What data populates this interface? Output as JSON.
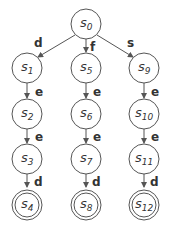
{
  "diagram": {
    "type": "state-machine-tree",
    "states": [
      {
        "id": "s0",
        "label": "s",
        "sub": "0",
        "accepting": false
      },
      {
        "id": "s1",
        "label": "s",
        "sub": "1",
        "accepting": false
      },
      {
        "id": "s2",
        "label": "s",
        "sub": "2",
        "accepting": false
      },
      {
        "id": "s3",
        "label": "s",
        "sub": "3",
        "accepting": false
      },
      {
        "id": "s4",
        "label": "s",
        "sub": "4",
        "accepting": true
      },
      {
        "id": "s5",
        "label": "s",
        "sub": "5",
        "accepting": false
      },
      {
        "id": "s6",
        "label": "s",
        "sub": "6",
        "accepting": false
      },
      {
        "id": "s7",
        "label": "s",
        "sub": "7",
        "accepting": false
      },
      {
        "id": "s8",
        "label": "s",
        "sub": "8",
        "accepting": true
      },
      {
        "id": "s9",
        "label": "s",
        "sub": "9",
        "accepting": false
      },
      {
        "id": "s10",
        "label": "s",
        "sub": "10",
        "accepting": false
      },
      {
        "id": "s11",
        "label": "s",
        "sub": "11",
        "accepting": false
      },
      {
        "id": "s12",
        "label": "s",
        "sub": "12",
        "accepting": true
      }
    ],
    "transitions": [
      {
        "from": "s0",
        "to": "s1",
        "label": "d"
      },
      {
        "from": "s0",
        "to": "s5",
        "label": "f"
      },
      {
        "from": "s0",
        "to": "s9",
        "label": "s"
      },
      {
        "from": "s1",
        "to": "s2",
        "label": "e"
      },
      {
        "from": "s2",
        "to": "s3",
        "label": "e"
      },
      {
        "from": "s3",
        "to": "s4",
        "label": "d"
      },
      {
        "from": "s5",
        "to": "s6",
        "label": "e"
      },
      {
        "from": "s6",
        "to": "s7",
        "label": "e"
      },
      {
        "from": "s7",
        "to": "s8",
        "label": "d"
      },
      {
        "from": "s9",
        "to": "s10",
        "label": "e"
      },
      {
        "from": "s10",
        "to": "s11",
        "label": "e"
      },
      {
        "from": "s11",
        "to": "s12",
        "label": "d"
      }
    ]
  }
}
